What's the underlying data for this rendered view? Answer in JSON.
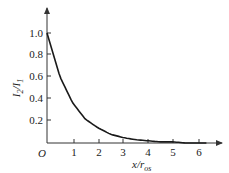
{
  "chart_data": {
    "type": "line",
    "title": "",
    "xlabel": "x/r_os",
    "ylabel": "I_2/I_1",
    "xlim": [
      0,
      6.5
    ],
    "ylim": [
      0,
      1.1
    ],
    "grid": false,
    "legend": null,
    "origin_label": "O",
    "x_ticks": [
      1,
      2,
      3,
      4,
      5,
      6
    ],
    "y_ticks": [
      0.2,
      0.4,
      0.6,
      0.8,
      1.0
    ],
    "x_tick_labels": [
      "1",
      "2",
      "3",
      "4",
      "5",
      "6"
    ],
    "y_tick_labels": [
      "0.2",
      "0.4",
      "0.6",
      "0.8",
      "1.0"
    ],
    "series": [
      {
        "name": "I2/I1",
        "description": "exponential decay, approximately exp(-x/r_os)",
        "x": [
          0,
          0.5,
          1,
          1.5,
          2,
          2.5,
          3,
          3.5,
          4,
          4.5,
          5,
          5.5,
          6,
          6.3
        ],
        "y": [
          1.0,
          0.61,
          0.37,
          0.22,
          0.14,
          0.08,
          0.05,
          0.03,
          0.02,
          0.01,
          0.01,
          0.0,
          0.0,
          0.0
        ]
      }
    ]
  },
  "labels": {
    "origin": "O",
    "y_main": "I",
    "y_sub1": "2",
    "y_slash": "/",
    "y_sub2": "1",
    "x_main": "x/r",
    "x_sub": "os"
  },
  "colors": {
    "axis": "#333333",
    "curve": "#1a1a1a",
    "text": "#222222"
  }
}
